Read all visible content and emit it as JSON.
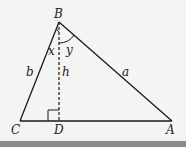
{
  "diagram": {
    "type": "triangle-with-altitude",
    "points": {
      "B": {
        "label": "B",
        "x": 59,
        "y": 22
      },
      "C": {
        "label": "C",
        "x": 20,
        "y": 121
      },
      "D": {
        "label": "D",
        "x": 59,
        "y": 121
      },
      "A": {
        "label": "A",
        "x": 172,
        "y": 121
      }
    },
    "sides": {
      "b": {
        "label": "b"
      },
      "a": {
        "label": "a"
      },
      "h": {
        "label": "h"
      }
    },
    "angles": {
      "x": {
        "label": "x"
      },
      "y": {
        "label": "y"
      }
    },
    "colors": {
      "line": "#1a1a1a",
      "background": "#f4f4f4",
      "band": "#8c8c8c"
    }
  }
}
